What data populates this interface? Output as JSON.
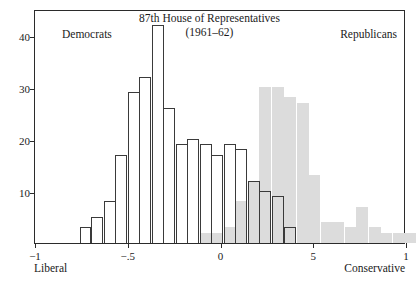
{
  "chart_data": {
    "type": "bar",
    "title": "87th House of Representatives",
    "subtitle": "(1961–62)",
    "xlabel": "",
    "ylabel": "",
    "xlim": [
      -1,
      1
    ],
    "ylim": [
      0,
      45
    ],
    "grid": false,
    "legend_position": "inside-top",
    "bin_width": 0.0645,
    "xticks": [
      {
        "value": -1,
        "label": "−1"
      },
      {
        "value": -0.5,
        "label": "−.5"
      },
      {
        "value": 0,
        "label": "0"
      },
      {
        "value": 0.5,
        "label": "5"
      },
      {
        "value": 1,
        "label": "1"
      }
    ],
    "yticks": [
      {
        "value": 10,
        "label": "10"
      },
      {
        "value": 20,
        "label": "20"
      },
      {
        "value": 30,
        "label": "30"
      },
      {
        "value": 40,
        "label": "40"
      }
    ],
    "annotations": [
      {
        "name": "democrats-caption",
        "text": "Democrats"
      },
      {
        "name": "republicans-caption",
        "text": "Republicans"
      },
      {
        "name": "left-endpoint",
        "text": "Liberal"
      },
      {
        "name": "right-endpoint",
        "text": "Conservative"
      }
    ],
    "series": [
      {
        "name": "Democrats",
        "style": "outline",
        "color": "#ffffff",
        "edge_color": "#3a3a3a",
        "bins": [
          {
            "x": -0.76,
            "value": 3
          },
          {
            "x": -0.7,
            "value": 5
          },
          {
            "x": -0.63,
            "value": 8
          },
          {
            "x": -0.57,
            "value": 17
          },
          {
            "x": -0.5,
            "value": 29
          },
          {
            "x": -0.44,
            "value": 32
          },
          {
            "x": -0.37,
            "value": 42
          },
          {
            "x": -0.31,
            "value": 26
          },
          {
            "x": -0.24,
            "value": 19
          },
          {
            "x": -0.18,
            "value": 20
          },
          {
            "x": -0.11,
            "value": 19
          },
          {
            "x": -0.05,
            "value": 17
          },
          {
            "x": 0.02,
            "value": 19
          },
          {
            "x": 0.08,
            "value": 18
          },
          {
            "x": 0.15,
            "value": 12
          },
          {
            "x": 0.21,
            "value": 10
          },
          {
            "x": 0.28,
            "value": 9
          },
          {
            "x": 0.34,
            "value": 3
          }
        ]
      },
      {
        "name": "Republicans",
        "style": "filled",
        "color": "#dcdcdc",
        "edge_color": "#dcdcdc",
        "bins": [
          {
            "x": -0.11,
            "value": 2
          },
          {
            "x": -0.05,
            "value": 2
          },
          {
            "x": 0.02,
            "value": 3
          },
          {
            "x": 0.08,
            "value": 8
          },
          {
            "x": 0.15,
            "value": 12
          },
          {
            "x": 0.21,
            "value": 30
          },
          {
            "x": 0.28,
            "value": 30
          },
          {
            "x": 0.34,
            "value": 28
          },
          {
            "x": 0.41,
            "value": 27
          },
          {
            "x": 0.47,
            "value": 13
          },
          {
            "x": 0.54,
            "value": 4
          },
          {
            "x": 0.6,
            "value": 4
          },
          {
            "x": 0.67,
            "value": 3
          },
          {
            "x": 0.73,
            "value": 7
          },
          {
            "x": 0.8,
            "value": 3
          },
          {
            "x": 0.86,
            "value": 2
          },
          {
            "x": 0.93,
            "value": 2
          },
          {
            "x": 0.99,
            "value": 2
          }
        ]
      }
    ]
  }
}
